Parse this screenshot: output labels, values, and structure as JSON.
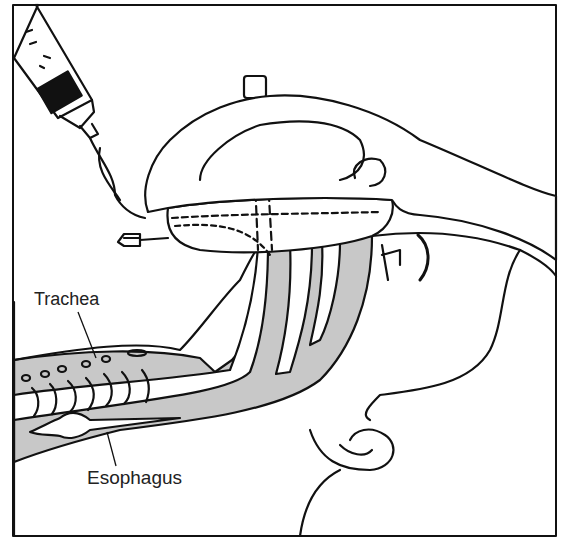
{
  "figure": {
    "labels": {
      "trachea": "Trachea",
      "esophagus": "Esophagus"
    },
    "colors": {
      "ink": "#111111",
      "tissue_shade": "#c8c8c8",
      "background": "#ffffff"
    }
  }
}
